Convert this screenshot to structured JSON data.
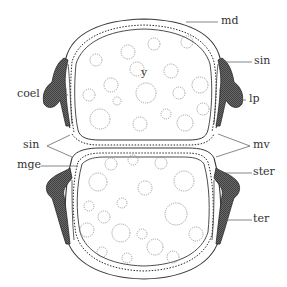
{
  "diagram": {
    "colors": {
      "line": "#3a3a3a",
      "granule": "#8a8a8a",
      "thickening": "#4a4a4a",
      "background": "#ffffff"
    },
    "labels": {
      "md": "md",
      "sin_top_right": "sin",
      "y": "y",
      "coel": "coel",
      "lp": "lp",
      "sin_left": "sin",
      "mv": "mv",
      "mge": "mge",
      "ster": "ster",
      "ter": "ter"
    }
  }
}
